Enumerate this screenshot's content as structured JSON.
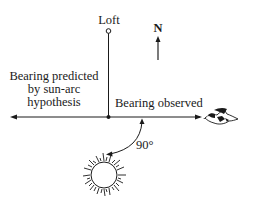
{
  "diagram": {
    "loft_label": "Loft",
    "north_label": "N",
    "predicted_label_lines": [
      "Bearing predicted",
      "by sun-arc",
      "hypothesis"
    ],
    "observed_label": "Bearing observed",
    "angle_label": "90°",
    "colors": {
      "ink": "#1a1a1a",
      "background": "#ffffff"
    }
  }
}
